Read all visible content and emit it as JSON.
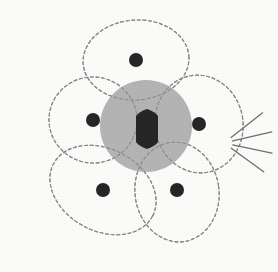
{
  "figure": {
    "domain": "Diagram",
    "canvas": {
      "width": 278,
      "height": 272
    },
    "background_color": "#fbfbfa"
  },
  "style": {
    "outline_color": "#8a8a8a",
    "outline_width": 1.1,
    "dash_pattern": "3 2.6",
    "disc_fill": "#b4b4b4",
    "dot_fill": "#262626",
    "ovary_fill": "#262626",
    "hatch_color": "#8d8d8d",
    "ray_color": "#6f6f6f"
  },
  "central_disc": {
    "label": "receptacle-disc",
    "cx": 146,
    "cy": 126,
    "r": 46,
    "fill": "#b4b4b4"
  },
  "ovary": {
    "label": "ovary",
    "cx": 147,
    "cy": 129,
    "half_width": 11,
    "half_height": 20,
    "shoulder": 7,
    "fill": "#262626"
  },
  "petals": [
    {
      "name": "petal-top",
      "cx": 136,
      "cy": 60,
      "rx": 53,
      "ry": 40,
      "rotation": -4
    },
    {
      "name": "petal-left",
      "cx": 93,
      "cy": 120,
      "rx": 44,
      "ry": 43,
      "rotation": 8
    },
    {
      "name": "petal-right",
      "cx": 199,
      "cy": 124,
      "rx": 44,
      "ry": 49,
      "rotation": -10
    },
    {
      "name": "petal-bottom-left",
      "cx": 103,
      "cy": 190,
      "rx": 56,
      "ry": 41,
      "rotation": 28
    },
    {
      "name": "petal-bottom-right",
      "cx": 177,
      "cy": 192,
      "rx": 42,
      "ry": 50,
      "rotation": -8
    }
  ],
  "dots": [
    {
      "name": "dot-top",
      "cx": 136,
      "cy": 60,
      "r": 7
    },
    {
      "name": "dot-left",
      "cx": 93,
      "cy": 120,
      "r": 7
    },
    {
      "name": "dot-right",
      "cx": 199,
      "cy": 124,
      "r": 7
    },
    {
      "name": "dot-bottom-left",
      "cx": 103,
      "cy": 190,
      "r": 7
    },
    {
      "name": "dot-bottom-right",
      "cx": 177,
      "cy": 190,
      "r": 7
    }
  ],
  "hatched_sector": {
    "name": "hatched-sector",
    "description": "diagonal hatching in upper-right lobe overlap",
    "line_count": 9,
    "line_angle_deg": 45
  },
  "rays": {
    "name": "radiating-rays",
    "origin_x": 224,
    "origin_y": 143,
    "count": 4,
    "angles_deg": [
      -38,
      -13,
      12,
      36
    ],
    "length": 40,
    "inner_gap": 9
  }
}
